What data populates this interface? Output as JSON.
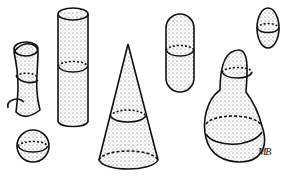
{
  "illustration": {
    "description": "Stippled line drawing of 3D shapes each with a cross-section ring",
    "shapes": [
      {
        "name": "curved-tube"
      },
      {
        "name": "tall-cylinder"
      },
      {
        "name": "small-sphere"
      },
      {
        "name": "cone"
      },
      {
        "name": "capsule"
      },
      {
        "name": "small-ellipsoid"
      },
      {
        "name": "gourd"
      }
    ],
    "signature": "MB",
    "colors": {
      "ink": "#111111",
      "background": "#ffffff"
    }
  }
}
